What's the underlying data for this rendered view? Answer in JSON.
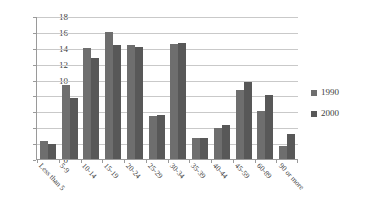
{
  "chart_data": {
    "type": "bar",
    "title": "",
    "subtitle": "",
    "xlabel": "",
    "ylabel": "",
    "ylim": [
      0,
      18
    ],
    "ytick_step": 2,
    "yticks": [
      "0",
      "2",
      "4",
      "6",
      "8",
      "10",
      "12",
      "14",
      "16",
      "18"
    ],
    "grid": true,
    "legend_position": "right",
    "categories": [
      "Less than 5",
      "5-9",
      "10-14",
      "15-19",
      "20-24",
      "25-29",
      "30-34",
      "35-39",
      "40-44",
      "45-59",
      "60-89",
      "90 or more"
    ],
    "series": [
      {
        "name": "1990",
        "color": "#6e6e6e",
        "values": [
          2.3,
          9.3,
          14.0,
          16.0,
          14.4,
          5.4,
          14.5,
          2.6,
          3.9,
          8.7,
          6.0,
          1.6
        ]
      },
      {
        "name": "2000",
        "color": "#585858",
        "values": [
          1.9,
          7.7,
          12.7,
          14.4,
          14.1,
          5.6,
          14.6,
          2.7,
          4.3,
          9.7,
          8.0,
          3.1
        ]
      }
    ]
  },
  "legend": {
    "items": [
      {
        "label": "1990",
        "color": "#6e6e6e"
      },
      {
        "label": "2000",
        "color": "#585858"
      }
    ]
  }
}
